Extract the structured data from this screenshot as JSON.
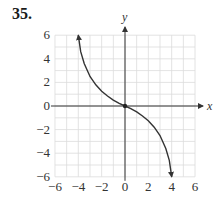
{
  "problem": {
    "number": "35."
  },
  "chart_data": {
    "type": "line",
    "title": "",
    "xlabel": "x",
    "ylabel": "y",
    "xlim": [
      -6,
      6
    ],
    "ylim": [
      -6,
      6
    ],
    "grid": true,
    "grid_minor_step": 1,
    "x_ticks": [
      -6,
      -4,
      -2,
      0,
      2,
      4,
      6
    ],
    "y_ticks": [
      6,
      4,
      2,
      0,
      -2,
      -4,
      -6
    ],
    "x_tick_labels": [
      "−6",
      "−4",
      "−2",
      "0",
      "2",
      "4",
      "6"
    ],
    "y_tick_labels": [
      "6",
      "4",
      "2",
      "0",
      "−2",
      "−4",
      "−6"
    ],
    "series": [
      {
        "name": "curve",
        "x": [
          -4,
          -3.8,
          -3.5,
          -3,
          -2.5,
          -2,
          -1.5,
          -1,
          -0.5,
          0,
          0.5,
          1,
          1.5,
          2,
          2.5,
          3,
          3.5,
          3.8,
          4
        ],
        "y": [
          6,
          4.6,
          3.6,
          2.5,
          1.8,
          1.25,
          0.85,
          0.5,
          0.22,
          0,
          -0.22,
          -0.5,
          -0.85,
          -1.25,
          -1.8,
          -2.5,
          -3.6,
          -4.6,
          -6
        ],
        "arrow_ends": true,
        "color": "#333333"
      }
    ],
    "points": [
      {
        "x": 0,
        "y": 0,
        "label": ""
      }
    ]
  },
  "colors": {
    "grid": "#dcdcdc",
    "axis": "#333333",
    "curve": "#333333"
  }
}
